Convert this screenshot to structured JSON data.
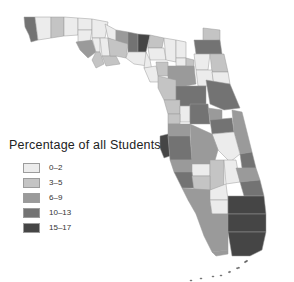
{
  "map": {
    "region": "Florida",
    "subdivision": "counties",
    "type": "choropleth"
  },
  "legend": {
    "title": "Percentage of all Students",
    "classes": [
      {
        "label": "0–2",
        "color": "#ececec"
      },
      {
        "label": "3–5",
        "color": "#c4c4c4"
      },
      {
        "label": "6–9",
        "color": "#9a9a9a"
      },
      {
        "label": "10–13",
        "color": "#737373"
      },
      {
        "label": "15–17",
        "color": "#454545"
      }
    ]
  }
}
